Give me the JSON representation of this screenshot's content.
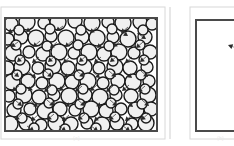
{
  "figure": {
    "type": "scientific-illustration",
    "background": "#ffffff",
    "width": 234,
    "height": 146,
    "caption_left": "(a)",
    "caption_right": "(b)"
  },
  "colors": {
    "outer_frame": "#d8d8d8",
    "panel_border": "#4a4a4a",
    "circle_stroke": "#1a1a1a",
    "circle_fill": "#f0f0f0",
    "arrow": "#2b2b2b",
    "divider": "#cfcfcf"
  },
  "panels": [
    {
      "id": "left-panel",
      "name": "dense-particle-field",
      "label": "(a)",
      "outer_frame": {
        "x": 1,
        "y": 7,
        "w": 164,
        "h": 132
      },
      "box": {
        "x": 5,
        "y": 18,
        "w": 152,
        "h": 113
      },
      "border_width": 2,
      "description": "Dense field of overlapping circles with short arrow vectors",
      "circle_count": 118,
      "arrow_count": 62,
      "circle_radius_range": [
        4,
        9
      ]
    },
    {
      "id": "right-panel",
      "name": "sparse-particle-field",
      "label": "(b)",
      "outer_frame": {
        "x": 190,
        "y": 7,
        "w": 60,
        "h": 132
      },
      "box": {
        "x": 196,
        "y": 20,
        "w": 58,
        "h": 111
      },
      "border_width": 2,
      "description": "Empty panel containing a single arrow marker",
      "circle_count": 0,
      "arrow_count": 1,
      "marker": {
        "x": 228,
        "y": 45,
        "angle": 200
      }
    }
  ],
  "divider": {
    "x": 170,
    "y1": 7,
    "y2": 139
  },
  "chart_data": {
    "type": "scatter",
    "title": "",
    "xlabel": "",
    "ylabel": "",
    "series": [
      {
        "name": "particles-left",
        "panel": "left-panel",
        "marker": "circle",
        "circles": [
          [
            11,
            24,
            7
          ],
          [
            27,
            22,
            8
          ],
          [
            44,
            23,
            6
          ],
          [
            58,
            22,
            8
          ],
          [
            75,
            21,
            7
          ],
          [
            92,
            23,
            8
          ],
          [
            108,
            22,
            6
          ],
          [
            123,
            23,
            8
          ],
          [
            140,
            22,
            7
          ],
          [
            152,
            24,
            6
          ],
          [
            8,
            39,
            6
          ],
          [
            21,
            37,
            7
          ],
          [
            36,
            38,
            8
          ],
          [
            51,
            36,
            6
          ],
          [
            66,
            38,
            8
          ],
          [
            82,
            37,
            7
          ],
          [
            97,
            38,
            8
          ],
          [
            113,
            37,
            6
          ],
          [
            128,
            39,
            8
          ],
          [
            145,
            37,
            7
          ],
          [
            13,
            53,
            8
          ],
          [
            29,
            52,
            6
          ],
          [
            43,
            54,
            7
          ],
          [
            59,
            52,
            8
          ],
          [
            74,
            53,
            6
          ],
          [
            89,
            52,
            8
          ],
          [
            104,
            54,
            7
          ],
          [
            119,
            52,
            8
          ],
          [
            134,
            53,
            6
          ],
          [
            150,
            52,
            7
          ],
          [
            7,
            68,
            7
          ],
          [
            22,
            67,
            8
          ],
          [
            38,
            68,
            6
          ],
          [
            53,
            66,
            8
          ],
          [
            68,
            68,
            7
          ],
          [
            84,
            67,
            8
          ],
          [
            99,
            68,
            6
          ],
          [
            115,
            67,
            8
          ],
          [
            130,
            68,
            7
          ],
          [
            147,
            67,
            6
          ],
          [
            12,
            82,
            8
          ],
          [
            28,
            81,
            7
          ],
          [
            42,
            83,
            6
          ],
          [
            57,
            81,
            8
          ],
          [
            72,
            82,
            7
          ],
          [
            88,
            81,
            8
          ],
          [
            103,
            83,
            6
          ],
          [
            118,
            81,
            7
          ],
          [
            133,
            82,
            8
          ],
          [
            149,
            81,
            6
          ],
          [
            9,
            96,
            6
          ],
          [
            24,
            95,
            8
          ],
          [
            39,
            97,
            7
          ],
          [
            54,
            95,
            6
          ],
          [
            69,
            96,
            8
          ],
          [
            85,
            95,
            7
          ],
          [
            100,
            97,
            8
          ],
          [
            116,
            95,
            6
          ],
          [
            131,
            96,
            7
          ],
          [
            148,
            95,
            8
          ],
          [
            14,
            110,
            7
          ],
          [
            30,
            109,
            6
          ],
          [
            45,
            111,
            8
          ],
          [
            60,
            109,
            7
          ],
          [
            75,
            110,
            6
          ],
          [
            91,
            109,
            8
          ],
          [
            106,
            111,
            7
          ],
          [
            121,
            109,
            6
          ],
          [
            136,
            110,
            8
          ],
          [
            151,
            109,
            7
          ],
          [
            10,
            124,
            8
          ],
          [
            26,
            123,
            7
          ],
          [
            41,
            125,
            6
          ],
          [
            56,
            123,
            8
          ],
          [
            71,
            124,
            7
          ],
          [
            87,
            123,
            6
          ],
          [
            102,
            125,
            8
          ],
          [
            117,
            123,
            7
          ],
          [
            132,
            124,
            6
          ],
          [
            146,
            123,
            8
          ],
          [
            19,
            30,
            5
          ],
          [
            50,
            29,
            5
          ],
          [
            81,
            30,
            5
          ],
          [
            112,
            29,
            5
          ],
          [
            143,
            30,
            5
          ],
          [
            16,
            45,
            5
          ],
          [
            47,
            46,
            5
          ],
          [
            78,
            45,
            5
          ],
          [
            109,
            46,
            5
          ],
          [
            140,
            45,
            5
          ],
          [
            20,
            60,
            5
          ],
          [
            51,
            61,
            5
          ],
          [
            82,
            60,
            5
          ],
          [
            113,
            61,
            5
          ],
          [
            144,
            60,
            5
          ],
          [
            17,
            75,
            5
          ],
          [
            48,
            74,
            5
          ],
          [
            79,
            75,
            5
          ],
          [
            110,
            74,
            5
          ],
          [
            141,
            75,
            5
          ],
          [
            21,
            89,
            5
          ],
          [
            52,
            90,
            5
          ],
          [
            83,
            89,
            5
          ],
          [
            114,
            90,
            5
          ],
          [
            145,
            89,
            5
          ],
          [
            18,
            104,
            5
          ],
          [
            49,
            103,
            5
          ],
          [
            80,
            104,
            5
          ],
          [
            111,
            103,
            5
          ],
          [
            142,
            104,
            5
          ],
          [
            22,
            118,
            5
          ],
          [
            53,
            117,
            5
          ],
          [
            84,
            118,
            5
          ],
          [
            115,
            117,
            5
          ],
          [
            146,
            118,
            5
          ],
          [
            34,
            128,
            5
          ],
          [
            65,
            129,
            5
          ],
          [
            96,
            128,
            5
          ],
          [
            127,
            129,
            5
          ]
        ]
      }
    ],
    "vectors": [
      [
        16,
        28,
        8,
        33
      ],
      [
        33,
        27,
        26,
        32
      ],
      [
        63,
        26,
        56,
        31
      ],
      [
        97,
        27,
        90,
        33
      ],
      [
        128,
        27,
        121,
        33
      ],
      [
        119,
        30,
        128,
        36
      ],
      [
        137,
        33,
        146,
        39
      ],
      [
        18,
        42,
        11,
        47
      ],
      [
        40,
        41,
        33,
        47
      ],
      [
        57,
        42,
        50,
        48
      ],
      [
        72,
        41,
        65,
        47
      ],
      [
        104,
        42,
        97,
        48
      ],
      [
        120,
        41,
        113,
        47
      ],
      [
        143,
        42,
        136,
        48
      ],
      [
        24,
        56,
        17,
        62
      ],
      [
        39,
        57,
        32,
        63
      ],
      [
        55,
        56,
        48,
        62
      ],
      [
        70,
        57,
        63,
        63
      ],
      [
        86,
        56,
        79,
        62
      ],
      [
        101,
        57,
        94,
        63
      ],
      [
        117,
        56,
        110,
        62
      ],
      [
        132,
        57,
        125,
        63
      ],
      [
        147,
        56,
        140,
        62
      ],
      [
        12,
        71,
        19,
        77
      ],
      [
        29,
        72,
        36,
        78
      ],
      [
        45,
        71,
        52,
        77
      ],
      [
        61,
        72,
        68,
        78
      ],
      [
        77,
        71,
        84,
        77
      ],
      [
        93,
        72,
        100,
        78
      ],
      [
        109,
        71,
        116,
        77
      ],
      [
        125,
        72,
        132,
        78
      ],
      [
        141,
        71,
        148,
        77
      ],
      [
        19,
        86,
        12,
        91
      ],
      [
        35,
        85,
        28,
        91
      ],
      [
        51,
        86,
        44,
        92
      ],
      [
        66,
        85,
        59,
        91
      ],
      [
        82,
        86,
        75,
        92
      ],
      [
        97,
        85,
        90,
        91
      ],
      [
        113,
        86,
        106,
        92
      ],
      [
        129,
        85,
        122,
        91
      ],
      [
        145,
        86,
        138,
        92
      ],
      [
        15,
        100,
        22,
        106
      ],
      [
        31,
        101,
        38,
        107
      ],
      [
        47,
        100,
        54,
        106
      ],
      [
        63,
        101,
        70,
        107
      ],
      [
        78,
        100,
        85,
        106
      ],
      [
        94,
        101,
        101,
        107
      ],
      [
        110,
        100,
        117,
        106
      ],
      [
        126,
        101,
        133,
        107
      ],
      [
        142,
        100,
        149,
        106
      ],
      [
        22,
        114,
        15,
        120
      ],
      [
        38,
        115,
        31,
        121
      ],
      [
        54,
        114,
        47,
        120
      ],
      [
        69,
        115,
        62,
        121
      ],
      [
        85,
        114,
        78,
        120
      ],
      [
        101,
        115,
        94,
        121
      ],
      [
        116,
        114,
        109,
        120
      ],
      [
        132,
        115,
        125,
        121
      ],
      [
        148,
        114,
        141,
        120
      ],
      [
        27,
        126,
        34,
        131
      ],
      [
        59,
        126,
        66,
        131
      ],
      [
        91,
        126,
        98,
        131
      ],
      [
        123,
        126,
        130,
        131
      ]
    ]
  }
}
